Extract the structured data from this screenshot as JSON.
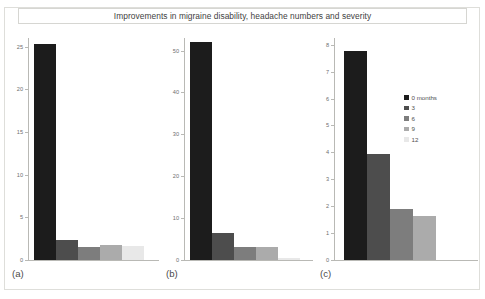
{
  "figure": {
    "title": "Improvements in migraine disability, headache numbers and severity",
    "background": "#ffffff",
    "frame_color": "#dededa"
  },
  "legend": {
    "position": "inside-panel-c-top-right",
    "entries": [
      {
        "label": "0 months",
        "color": "#1c1c1c"
      },
      {
        "label": "3",
        "color": "#4d4d4d"
      },
      {
        "label": "6",
        "color": "#7d7d7d"
      },
      {
        "label": "9",
        "color": "#ababab"
      },
      {
        "label": "12",
        "color": "#e8e8e8"
      }
    ]
  },
  "chart_data": [
    {
      "type": "bar",
      "id": "a",
      "panel_label": "(a)",
      "title": "",
      "xlabel": "",
      "ylabel": "",
      "categories": [
        "0 months",
        "3",
        "6",
        "9",
        "12"
      ],
      "values": [
        25.3,
        2.4,
        1.5,
        1.8,
        1.6
      ],
      "colors": [
        "#1c1c1c",
        "#4d4d4d",
        "#7d7d7d",
        "#ababab",
        "#e8e8e8"
      ],
      "ylim": [
        0,
        26
      ],
      "yticks": [
        0,
        5,
        10,
        15,
        20,
        25
      ],
      "ytick_labels": [
        "0",
        "5",
        "10",
        "15",
        "20",
        "25"
      ],
      "grid": false
    },
    {
      "type": "bar",
      "id": "b",
      "panel_label": "(b)",
      "title": "",
      "xlabel": "",
      "ylabel": "",
      "categories": [
        "0 months",
        "3",
        "6",
        "9",
        "12"
      ],
      "values": [
        52.0,
        6.5,
        3.0,
        3.2,
        0.5
      ],
      "colors": [
        "#1c1c1c",
        "#4d4d4d",
        "#7d7d7d",
        "#ababab",
        "#e8e8e8"
      ],
      "ylim": [
        0,
        53
      ],
      "yticks": [
        0,
        10,
        20,
        30,
        40,
        50
      ],
      "ytick_labels": [
        "0",
        "10",
        "20",
        "30",
        "40",
        "50"
      ],
      "grid": false
    },
    {
      "type": "bar",
      "id": "c",
      "panel_label": "(c)",
      "title": "",
      "xlabel": "",
      "ylabel": "",
      "categories": [
        "0 months",
        "3",
        "6",
        "9",
        "12"
      ],
      "values": [
        7.75,
        3.95,
        1.9,
        1.65,
        0.0
      ],
      "colors": [
        "#1c1c1c",
        "#4d4d4d",
        "#7d7d7d",
        "#ababab",
        "#e8e8e8"
      ],
      "ylim": [
        0,
        8.25
      ],
      "yticks": [
        0,
        1,
        2,
        3,
        4,
        5,
        6,
        7,
        8
      ],
      "ytick_labels": [
        "0",
        "1",
        "2",
        "3",
        "4",
        "5",
        "6",
        "7",
        "8"
      ],
      "grid": false
    }
  ]
}
